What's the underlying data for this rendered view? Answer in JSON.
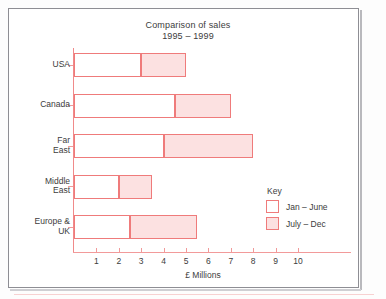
{
  "figure": {
    "frame_border_color": "#8e8e94",
    "background_color": "#ffffff"
  },
  "chart_data": {
    "type": "bar",
    "orientation": "horizontal",
    "stacked": true,
    "title": "Comparison of sales\n1995 – 1999",
    "title_line1": "Comparison of sales",
    "title_line2": "1995 – 1999",
    "xlabel": "£ Millions",
    "ylabel": "",
    "xlim": [
      0,
      10
    ],
    "xticks": [
      1,
      2,
      3,
      4,
      5,
      6,
      7,
      8,
      9,
      10
    ],
    "xtick_labels": [
      "1",
      "2",
      "3",
      "4",
      "5",
      "6",
      "7",
      "8",
      "9",
      "10"
    ],
    "grid": false,
    "legend_position": "right",
    "categories": [
      "USA",
      "Canada",
      "Far\nEast",
      "Middle\nEast",
      "Europe &\nUK"
    ],
    "series": [
      {
        "name": "Jan – June",
        "fill_color": "#ffffff",
        "border_color": "#ef7b7b",
        "values": [
          3,
          4.5,
          4,
          2,
          2.5
        ]
      },
      {
        "name": "July – Dec",
        "fill_color": "#fce1e1",
        "border_color": "#ef7b7b",
        "values": [
          2,
          2.5,
          4,
          1.5,
          3
        ]
      }
    ],
    "totals": [
      5,
      7,
      8,
      3.5,
      5.5
    ],
    "units": "£ Millions",
    "axis_color": "#f09a9a",
    "text_color": "#3c3c3c"
  },
  "legend": {
    "title": "Key",
    "items": [
      {
        "label": "Jan – June",
        "swatch": "white-swatch"
      },
      {
        "label": "July – Dec",
        "swatch": "pink-swatch"
      }
    ]
  }
}
